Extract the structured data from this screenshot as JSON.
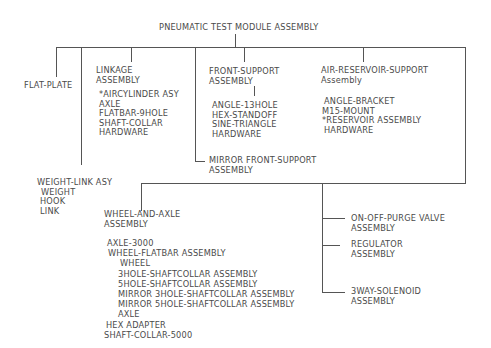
{
  "title": "PNEUMATIC TEST MODULE ASSEMBLY",
  "nodes": {
    "flat_plate": {
      "label": "FLAT-PLATE"
    },
    "linkage": {
      "label": [
        "LINKAGE",
        "ASSEMBLY"
      ],
      "parts": [
        "*AIRCYLINDER ASY",
        "AXLE",
        "FLATBAR-9HOLE",
        "SHAFT-COLLAR",
        "HARDWARE"
      ]
    },
    "front_support": {
      "label": [
        "FRONT-SUPPORT",
        "ASSEMBLY"
      ],
      "parts": [
        "ANGLE-13HOLE",
        "HEX-STANDOFF",
        "SINE-TRIANGLE",
        "HARDWARE"
      ]
    },
    "mirror_front_support": {
      "label": [
        "MIRROR FRONT-SUPPORT",
        "ASSEMBLY"
      ]
    },
    "air_reservoir_support": {
      "label": [
        "AIR-RESERVOIR-SUPPORT",
        "Assembly"
      ],
      "parts": [
        "ANGLE-BRACKET",
        "M15-MOUNT",
        "*RESERVOIR ASSEMBLY",
        "HARDWARE"
      ]
    },
    "weight_link": {
      "label": "WEIGHT-LINK ASY",
      "parts": [
        "WEIGHT",
        "HOOK",
        "LINK"
      ]
    },
    "wheel_and_axle": {
      "label": [
        "WHEEL-AND-AXLE",
        "ASSEMBLY"
      ],
      "parts": [
        {
          "text": "AXLE-3000",
          "indent": 0
        },
        {
          "text": "WHEEL-FLATBAR ASSEMBLY",
          "indent": 1
        },
        {
          "text": "WHEEL",
          "indent": 3
        },
        {
          "text": "3HOLE-SHAFTCOLLAR ASSEMBLY",
          "indent": 3
        },
        {
          "text": "5HOLE-SHAFTCOLLAR ASSEMBLY",
          "indent": 3
        },
        {
          "text": "MIRROR 3HOLE-SHAFTCOLLAR ASSEMBLY",
          "indent": 3
        },
        {
          "text": "MIRROR 5HOLE-SHAFTCOLLAR ASSEMBLY",
          "indent": 3
        },
        {
          "text": "AXLE",
          "indent": 3
        },
        {
          "text": "HEX ADAPTER",
          "indent": 1
        },
        {
          "text": "SHAFT-COLLAR-5000",
          "indent": 0
        }
      ]
    },
    "on_off_purge_valve": {
      "label": [
        "ON-OFF-PURGE VALVE",
        "ASSEMBLY"
      ]
    },
    "regulator": {
      "label": [
        "REGULATOR",
        "ASSEMBLY"
      ]
    },
    "three_way_solenoid": {
      "label": [
        "3WAY-SOLENOID",
        "ASSEMBLY"
      ]
    }
  }
}
